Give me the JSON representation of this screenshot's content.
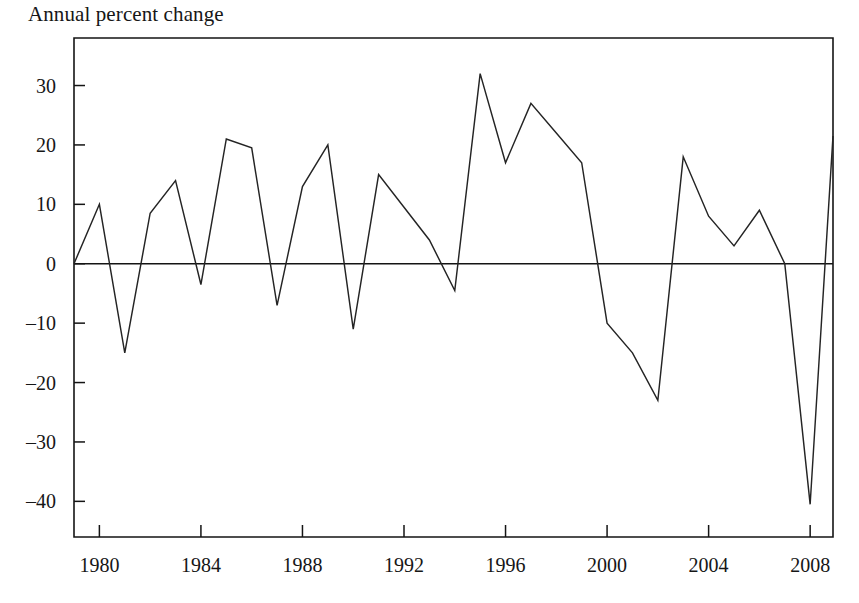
{
  "chart_data": {
    "type": "line",
    "title": "Annual percent change",
    "xlabel": "",
    "ylabel": "",
    "grid": false,
    "legend": "none",
    "xlim": [
      1979,
      2008.9
    ],
    "ylim": [
      -46,
      38
    ],
    "yticks": [
      30,
      20,
      10,
      0,
      -10,
      -20,
      -30,
      -40
    ],
    "ytick_labels": [
      "30",
      "20",
      "10",
      "0",
      "–10",
      "–20",
      "–30",
      "–40"
    ],
    "xticks": [
      1980,
      1984,
      1988,
      1992,
      1996,
      2000,
      2004,
      2008
    ],
    "xtick_labels": [
      "1980",
      "1984",
      "1988",
      "1992",
      "1996",
      "2000",
      "2004",
      "2008"
    ],
    "x": [
      1979,
      1980,
      1981,
      1982,
      1983,
      1984,
      1985,
      1986,
      1987,
      1988,
      1989,
      1990,
      1991,
      1992,
      1993,
      1994,
      1995,
      1996,
      1997,
      1998,
      1999,
      2000,
      2001,
      2002,
      2003,
      2004,
      2005,
      2006,
      2007,
      2008,
      2008.9
    ],
    "values": [
      0,
      10,
      -15,
      8.5,
      14,
      -3.5,
      21,
      19.5,
      -7,
      13,
      20,
      -11,
      15,
      9.5,
      4,
      -4.5,
      32,
      17,
      27,
      22,
      17,
      -10,
      -15,
      -23,
      18,
      8,
      3,
      9,
      0,
      -40.5,
      21.5
    ],
    "series": [
      {
        "name": "Annual percent change",
        "values": [
          0,
          10,
          -15,
          8.5,
          14,
          -3.5,
          21,
          19.5,
          -7,
          13,
          20,
          -11,
          15,
          9.5,
          4,
          -4.5,
          32,
          17,
          27,
          22,
          17,
          -10,
          -15,
          -23,
          18,
          8,
          3,
          9,
          0,
          -40.5,
          21.5
        ]
      }
    ],
    "zero_reference_line": 0,
    "line_color": "#242424",
    "axis_color": "#141414",
    "background": "#ffffff"
  }
}
